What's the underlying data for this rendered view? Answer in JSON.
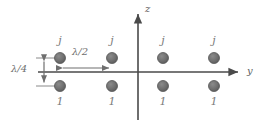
{
  "figure": {
    "background_color": "#ffffff",
    "width": 269,
    "height": 126
  },
  "axes": {
    "horizontal": {
      "name": "y-axis",
      "label": "y",
      "label_x": 247,
      "label_y": 67,
      "x_start": 38,
      "x_end": 242,
      "y": 72,
      "color": "#4a4a4a"
    },
    "vertical": {
      "name": "z-axis",
      "label": "z",
      "label_x": 145,
      "label_y": 5,
      "x": 138,
      "y_start": 120,
      "y_end": 10,
      "color": "#4a4a4a"
    }
  },
  "elements": {
    "dot_color": "#6f6f6f",
    "dot_stroke": "#4f4f4f",
    "dot_radius": 5.5,
    "columns_x": [
      60,
      112,
      163,
      214
    ],
    "top_row_y": 58,
    "bottom_row_y": 86,
    "top_labels": [
      "j",
      "j",
      "j",
      "j"
    ],
    "bottom_labels": [
      "1",
      "1",
      "1",
      "1"
    ],
    "top_label_y": 36,
    "bottom_label_y": 96
  },
  "dimensions": {
    "vertical": {
      "name": "quarter-wavelength",
      "label": "λ/4",
      "label_x": 12,
      "label_y": 65,
      "arrow_x": 44,
      "y_top": 58,
      "y_bottom": 86,
      "tick_x_start": 36,
      "tick_x_end": 60,
      "color": "#6e6e6e"
    },
    "horizontal": {
      "name": "half-wavelength",
      "label": "λ/2",
      "label_x": 72,
      "label_y": 48,
      "arrow_y": 68,
      "x_left": 60,
      "x_right": 112,
      "color": "#6e6e6e"
    }
  }
}
